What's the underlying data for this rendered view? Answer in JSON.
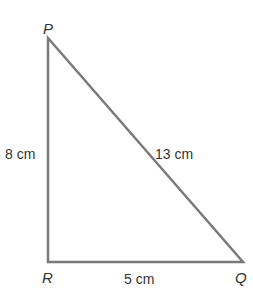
{
  "diagram": {
    "type": "right-triangle",
    "stroke_color": "#7a7a7a",
    "text_color": "#333333",
    "vertices": {
      "P": {
        "label": "P",
        "x": 48,
        "y": 38
      },
      "R": {
        "label": "R",
        "x": 48,
        "y": 262
      },
      "Q": {
        "label": "Q",
        "x": 243,
        "y": 262
      }
    },
    "sides": {
      "PR": {
        "label": "8 cm"
      },
      "PQ": {
        "label": "13 cm"
      },
      "RQ": {
        "label": "5 cm"
      }
    }
  }
}
